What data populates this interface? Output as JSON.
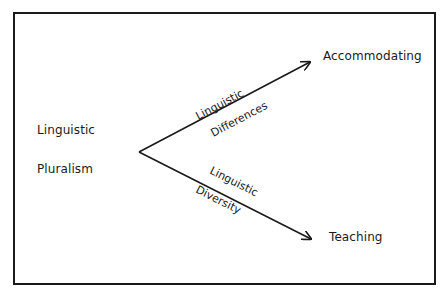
{
  "diagram": {
    "source": {
      "line1": "Linguistic",
      "line2": "Pluralism"
    },
    "branches": [
      {
        "label_above": "Linguistic",
        "label_below": "Differences",
        "target": "Accommodating"
      },
      {
        "label_above": "Linguistic",
        "label_below": "Diversity",
        "target": "Teaching"
      }
    ],
    "colors": {
      "ink": "#1a1a1a",
      "background": "#ffffff"
    }
  }
}
